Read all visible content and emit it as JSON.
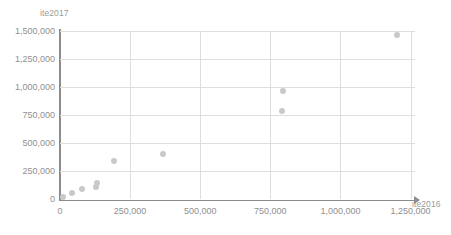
{
  "chart_data": {
    "type": "scatter",
    "title": "",
    "xlabel": "ite2016",
    "ylabel": "ite2017",
    "xlim": [
      0,
      1266000
    ],
    "ylim": [
      0,
      1500000
    ],
    "grid": true,
    "legend": "none",
    "marker_color": "#c9c9c9",
    "xticks": [
      "0",
      "250,000",
      "500,000",
      "750,000",
      "1,000,000",
      "1,250,000"
    ],
    "xtick_values": [
      0,
      250000,
      500000,
      750000,
      1000000,
      1250000
    ],
    "yticks": [
      "0",
      "250,000",
      "500,000",
      "750,000",
      "1,000,000",
      "1,250,000",
      "1,500,000"
    ],
    "ytick_values": [
      0,
      250000,
      500000,
      750000,
      1000000,
      1250000,
      1500000
    ],
    "series": [
      {
        "name": "ite2016 vs ite2017",
        "points": [
          {
            "x": 10000,
            "y": 15000
          },
          {
            "x": 43000,
            "y": 50000
          },
          {
            "x": 79000,
            "y": 88000
          },
          {
            "x": 129000,
            "y": 105000
          },
          {
            "x": 132000,
            "y": 140000
          },
          {
            "x": 193000,
            "y": 340000
          },
          {
            "x": 368000,
            "y": 400000
          },
          {
            "x": 790000,
            "y": 790000
          },
          {
            "x": 796000,
            "y": 965000
          },
          {
            "x": 1203000,
            "y": 1460000
          }
        ]
      }
    ]
  },
  "axes": {
    "y_title": "ite2017",
    "x_title": "ite2016"
  },
  "colors": {
    "marker": "#c9c9c9",
    "grid": "#dedede",
    "axis": "#8c8c8c",
    "text": "#8f8f8f",
    "background": "#ffffff"
  }
}
